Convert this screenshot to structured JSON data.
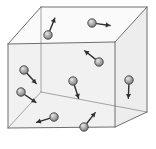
{
  "figure": {
    "name": "gas-particles-in-cube",
    "background_color": "#ffffff",
    "width": 156,
    "height": 149
  },
  "cube": {
    "edge_color": "#6e6e6e",
    "hidden_edge_color": "#9a9a9a",
    "face_fill_front": "#f1f1f1",
    "face_fill_top": "#fafafa",
    "face_fill_right": "#ededed",
    "vertices": {
      "front_top_left": [
        8,
        44
      ],
      "front_top_right": [
        115,
        42
      ],
      "front_bottom_left": [
        8,
        128
      ],
      "front_bottom_right": [
        115,
        127
      ],
      "back_top_left": [
        41,
        7
      ],
      "back_top_right": [
        147,
        7
      ],
      "back_bottom_left": [
        41,
        92
      ],
      "back_bottom_right": [
        147,
        112
      ]
    }
  },
  "particles": [
    {
      "id": "particle-top-left",
      "label": "particle 1",
      "cx": 48,
      "cy": 35,
      "r": 4.2,
      "arrow_angle_deg": -68,
      "arrow_length": 14,
      "color": "#b0b0b0"
    },
    {
      "id": "particle-top-right",
      "label": "particle 2",
      "cx": 92,
      "cy": 23,
      "r": 4.2,
      "arrow_angle_deg": 8,
      "arrow_length": 14,
      "color": "#b0b0b0"
    },
    {
      "id": "particle-upper-mid-right",
      "label": "particle 3",
      "cx": 99,
      "cy": 62,
      "r": 4.2,
      "arrow_angle_deg": -142,
      "arrow_length": 14,
      "color": "#b0b0b0"
    },
    {
      "id": "particle-right-edge",
      "label": "particle 4",
      "cx": 129,
      "cy": 80,
      "r": 4.2,
      "arrow_angle_deg": 92,
      "arrow_length": 14,
      "color": "#b0b0b0"
    },
    {
      "id": "particle-center",
      "label": "particle 5",
      "cx": 73,
      "cy": 81,
      "r": 4.2,
      "arrow_angle_deg": 72,
      "arrow_length": 14,
      "color": "#b0b0b0"
    },
    {
      "id": "particle-left-upper",
      "label": "particle 6",
      "cx": 24,
      "cy": 70,
      "r": 4.2,
      "arrow_angle_deg": 48,
      "arrow_length": 14,
      "color": "#b0b0b0"
    },
    {
      "id": "particle-left-lower",
      "label": "particle 7",
      "cx": 21,
      "cy": 92,
      "r": 4.2,
      "arrow_angle_deg": 35,
      "arrow_length": 14,
      "color": "#b0b0b0"
    },
    {
      "id": "particle-bottom-left",
      "label": "particle 8",
      "cx": 54,
      "cy": 117,
      "r": 4.2,
      "arrow_angle_deg": 163,
      "arrow_length": 14,
      "color": "#b0b0b0"
    },
    {
      "id": "particle-bottom-center",
      "label": "particle 9",
      "cx": 84,
      "cy": 127,
      "r": 4.2,
      "arrow_angle_deg": -52,
      "arrow_length": 14,
      "color": "#b0b0b0"
    }
  ]
}
